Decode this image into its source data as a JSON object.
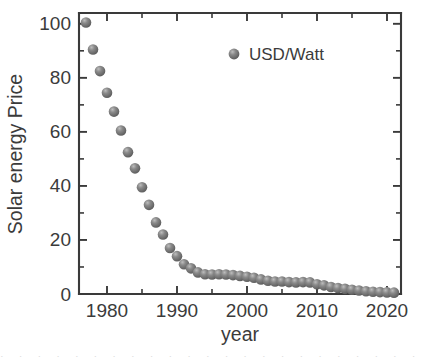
{
  "chart_data": {
    "type": "scatter",
    "title": "",
    "xlabel": "year",
    "ylabel": "Solar energy Price",
    "xlim": [
      1976,
      2022
    ],
    "ylim": [
      0,
      104
    ],
    "xticks": [
      1980,
      1990,
      2000,
      2010,
      2020
    ],
    "xtick_labels": [
      "1980",
      "1990",
      "2000",
      "2010",
      "2020"
    ],
    "x_minor_interval": 5,
    "yticks": [
      0,
      20,
      40,
      60,
      80,
      100
    ],
    "ytick_labels": [
      "0",
      "20",
      "40",
      "60",
      "80",
      "100"
    ],
    "y_minor_interval": 10,
    "grid": false,
    "legend_position": "top-center",
    "marker_color": "#6e6e6e",
    "marker_style": "sphere",
    "axis_color": "#3a3a3a",
    "background": "#ffffff",
    "series": [
      {
        "name": "USD/Watt",
        "x": [
          1977,
          1978,
          1979,
          1980,
          1981,
          1982,
          1983,
          1984,
          1985,
          1986,
          1987,
          1988,
          1989,
          1990,
          1991,
          1992,
          1993,
          1994,
          1995,
          1996,
          1997,
          1998,
          1999,
          2000,
          2001,
          2002,
          2003,
          2004,
          2005,
          2006,
          2007,
          2008,
          2009,
          2010,
          2011,
          2012,
          2013,
          2014,
          2015,
          2016,
          2017,
          2018,
          2019,
          2020,
          2021
        ],
        "values": [
          100.5,
          90.5,
          82.5,
          74.5,
          67.5,
          60.5,
          52.5,
          46.5,
          39.5,
          33.0,
          26.5,
          22.0,
          17.0,
          14.0,
          11.0,
          9.5,
          8.0,
          7.3,
          7.2,
          7.3,
          7.2,
          7.0,
          6.7,
          6.4,
          6.0,
          5.4,
          4.9,
          4.6,
          4.6,
          4.4,
          4.3,
          4.4,
          4.3,
          3.6,
          3.2,
          2.6,
          2.2,
          1.9,
          1.6,
          1.3,
          1.0,
          0.85,
          0.7,
          0.6,
          0.5
        ]
      }
    ]
  },
  "legend": {
    "entries": [
      {
        "label": "USD/Watt",
        "marker": "sphere-marker"
      }
    ]
  },
  "axes": {
    "x_title": "year",
    "y_title": "Solar energy Price"
  },
  "bottom_artifact": {
    "text": "· · · · · · · · · · · · · · · · · · · · · · · · · · · · · · · · · · ·"
  }
}
